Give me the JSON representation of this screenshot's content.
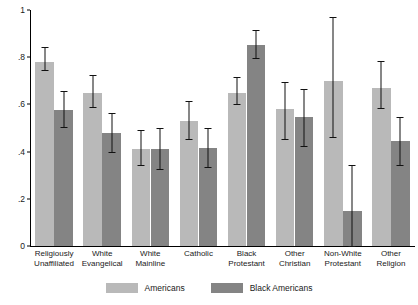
{
  "chart_data": {
    "type": "bar",
    "title": "",
    "subtitle": "",
    "xlabel": "",
    "ylabel": "",
    "ylim": [
      0,
      1
    ],
    "grid": false,
    "legend_position": "bottom",
    "ytick_labels": [
      "1",
      ".8",
      ".6",
      ".4",
      ".2",
      "0"
    ],
    "ytick_values": [
      1,
      0.8,
      0.6,
      0.4,
      0.2,
      0
    ],
    "categories": [
      "Religiously Unaffiliated",
      "White Evangelical",
      "White Mainline",
      "Catholic",
      "Black Protestant",
      "Other Christian",
      "Non-White Protestant",
      "Other Religion"
    ],
    "category_lines": [
      [
        "Religiously",
        "Unaffiliated"
      ],
      [
        "White",
        "Evangelical"
      ],
      [
        "White",
        "Mainline"
      ],
      [
        "Catholic",
        ""
      ],
      [
        "Black",
        "Protestant"
      ],
      [
        "Other",
        "Christian"
      ],
      [
        "Non-White",
        "Protestant"
      ],
      [
        "Other",
        "Religion"
      ]
    ],
    "series": [
      {
        "name": "Americans",
        "color": "#b9b9b9",
        "values": [
          0.78,
          0.65,
          0.41,
          0.53,
          0.65,
          0.58,
          0.7,
          0.67
        ],
        "ci_low": [
          0.745,
          0.59,
          0.345,
          0.455,
          0.6,
          0.455,
          0.46,
          0.585
        ],
        "ci_high": [
          0.845,
          0.725,
          0.49,
          0.615,
          0.715,
          0.695,
          0.97,
          0.785
        ]
      },
      {
        "name": "Black Americans",
        "color": "#848484",
        "values": [
          0.575,
          0.48,
          0.41,
          0.415,
          0.85,
          0.545,
          0.15,
          0.445
        ],
        "ci_low": [
          0.505,
          0.4,
          0.325,
          0.335,
          0.795,
          0.425,
          0.0,
          0.345
        ],
        "ci_high": [
          0.655,
          0.565,
          0.5,
          0.5,
          0.915,
          0.665,
          0.345,
          0.545
        ]
      }
    ]
  },
  "legend": {
    "entries": [
      {
        "label": "Americans",
        "swatch": "americans"
      },
      {
        "label": "Black Americans",
        "swatch": "black-americans"
      }
    ]
  }
}
